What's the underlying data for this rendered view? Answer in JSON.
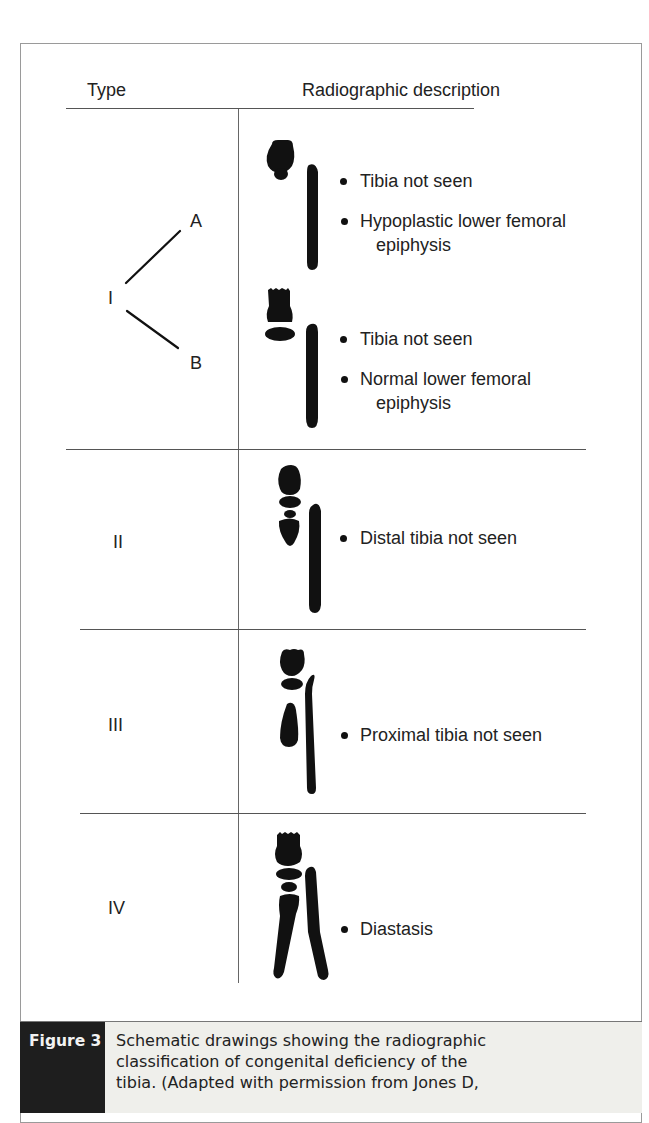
{
  "table": {
    "headers": {
      "type": "Type",
      "description": "Radiographic description"
    },
    "rows": [
      {
        "type": "I",
        "subtypes": [
          {
            "label": "A",
            "bullets": [
              "Tibia not seen",
              "Hypoplastic lower femoral",
              "epiphysis"
            ]
          },
          {
            "label": "B",
            "bullets": [
              "Tibia not seen",
              "Normal lower femoral",
              "epiphysis"
            ]
          }
        ]
      },
      {
        "type": "II",
        "bullets": [
          "Distal tibia not seen"
        ]
      },
      {
        "type": "III",
        "bullets": [
          "Proximal tibia not seen"
        ]
      },
      {
        "type": "IV",
        "bullets": [
          "Diastasis"
        ]
      }
    ]
  },
  "caption": {
    "label": "Figure 3",
    "lines": [
      "Schematic drawings showing the radiographic",
      "classification of congenital deficiency of the",
      "tibia. (Adapted with permission from Jones D,"
    ]
  },
  "colors": {
    "ink": "#111111",
    "rule": "#555555",
    "caption_label_bg": "#1e1e1e",
    "caption_bg": "#efefeb"
  }
}
